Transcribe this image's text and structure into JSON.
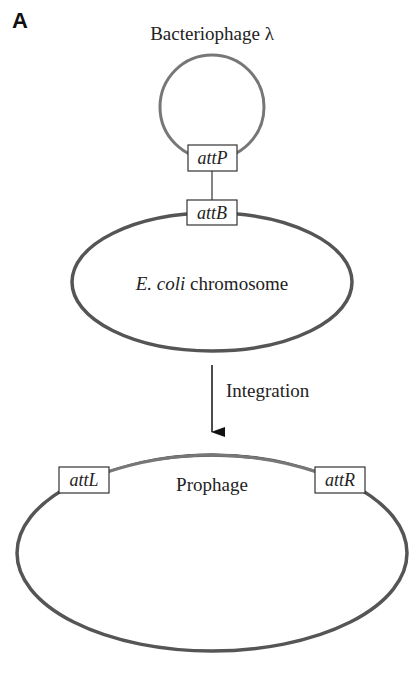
{
  "panel_label": "A",
  "phage": {
    "title": "Bacteriophage λ",
    "site": "attP",
    "color": "#777777"
  },
  "chromosome": {
    "site": "attB",
    "label_italic": "E. coli",
    "label_rest": " chromosome",
    "color": "#555555"
  },
  "step": {
    "label": "Integration"
  },
  "result": {
    "left_site": "attL",
    "right_site": "attR",
    "label": "Prophage",
    "phage_segment_color": "#777777",
    "chromosome_color": "#555555"
  }
}
